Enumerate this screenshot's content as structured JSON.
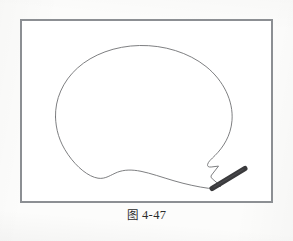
{
  "page": {
    "background_color": "#fcfcfb",
    "width": 293,
    "height": 241
  },
  "figure": {
    "frame": {
      "border_color": "#8c8f93",
      "fill_color": "#ffffff",
      "x": 20,
      "y": 19,
      "width": 253,
      "height": 184,
      "border_width": 2
    },
    "artwork": {
      "name": "speech-balloon-outline-with-brush-stroke",
      "line_color": "#6f7073",
      "line_width": 0.9,
      "stroke_color": "#3a3a3c",
      "stroke_width": 5,
      "balloon_path": "M 34 95 C 34 62, 62 32, 110 22 C 158 12, 200 30, 210 62 C 218 88, 208 112, 196 128 C 190 136, 187 140, 189 145 L 196 143 L 190 152 L 196 160 L 185 163 L 175 165 C 160 163, 142 158, 126 153 C 112 148, 100 145, 90 147 C 78 149, 68 153, 56 146 C 42 137, 34 118, 34 95 Z",
      "brush_stroke_from": [
        190,
        167
      ],
      "brush_stroke_to": [
        223,
        147
      ]
    }
  },
  "caption": {
    "full_text": "图 4-47",
    "label_cn": "图",
    "number": "4-47"
  }
}
